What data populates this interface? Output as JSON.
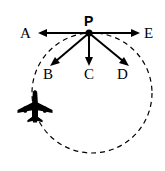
{
  "figure": {
    "background_color": "#ffffff",
    "stroke_color": "#000000",
    "width": 165,
    "height": 171
  },
  "labels": {
    "vertex": "P",
    "left": "A",
    "down_left": "B",
    "down": "C",
    "down_right": "D",
    "right": "E"
  },
  "vectors": [
    {
      "name": "A",
      "label": "A",
      "direction": "left",
      "from": [
        89,
        33
      ],
      "to": [
        38,
        33
      ],
      "arrowhead": true
    },
    {
      "name": "B",
      "label": "B",
      "direction": "down-left",
      "from": [
        89,
        33
      ],
      "to": [
        51,
        65
      ],
      "arrowhead": true
    },
    {
      "name": "C",
      "label": "C",
      "direction": "down",
      "from": [
        89,
        33
      ],
      "to": [
        89,
        65
      ],
      "arrowhead": true
    },
    {
      "name": "D",
      "label": "D",
      "direction": "down-right",
      "from": [
        89,
        33
      ],
      "to": [
        128,
        65
      ],
      "arrowhead": true
    },
    {
      "name": "E",
      "label": "E",
      "direction": "right",
      "from": [
        89,
        33
      ],
      "to": [
        140,
        33
      ],
      "arrowhead": true
    }
  ],
  "path": {
    "shape": "circle",
    "style": "dashed",
    "center": [
      92,
      93
    ],
    "radius": 60,
    "dash_pattern": "5 4",
    "stroke_width": 1.2
  },
  "aircraft": {
    "icon": "airplane-icon",
    "heading": "up",
    "position": [
      35,
      107
    ],
    "fill": "#000000"
  }
}
